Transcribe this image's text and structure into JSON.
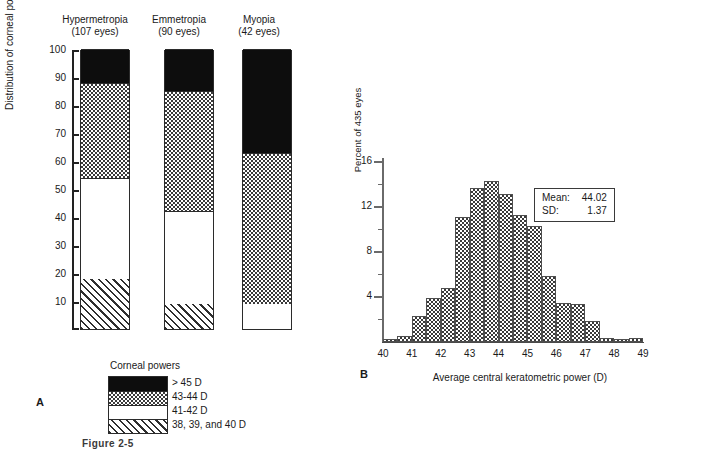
{
  "figure": {
    "caption": "Figure 2-5"
  },
  "panelA": {
    "letter": "A",
    "y_axis_label": "Distribution of corneal powers (%)",
    "y_ticks": [
      10,
      20,
      30,
      40,
      50,
      60,
      70,
      80,
      90,
      100
    ],
    "columns": [
      {
        "name": "Hypermetropia",
        "sub": "(107 eyes)"
      },
      {
        "name": "Emmetropia",
        "sub": "(90 eyes)"
      },
      {
        "name": "Myopia",
        "sub": "(42 eyes)"
      }
    ],
    "legend_title": "Corneal powers",
    "legend": [
      {
        "label": "> 45 D",
        "pattern": "black"
      },
      {
        "label": "43-44 D",
        "pattern": "check"
      },
      {
        "label": "41-42 D",
        "pattern": "white"
      },
      {
        "label": "38, 39, and 40 D",
        "pattern": "hatch"
      }
    ]
  },
  "panelB": {
    "letter": "B",
    "y_axis_label": "Percent of 435 eyes",
    "x_axis_label": "Average central keratometric power (D)",
    "stats": {
      "mean_label": "Mean:",
      "mean_value": "44.02",
      "sd_label": "SD:",
      "sd_value": "1.37"
    }
  },
  "chart_data": [
    {
      "type": "bar",
      "id": "panel-a-stacked",
      "title": "Distribution of corneal powers (%)",
      "xlabel": "",
      "ylabel": "Distribution of corneal powers (%)",
      "ylim": [
        0,
        100
      ],
      "grid": false,
      "stacked": true,
      "categories": [
        "Hypermetropia (107 eyes)",
        "Emmetropia (90 eyes)",
        "Myopia (42 eyes)"
      ],
      "series": [
        {
          "name": "38, 39, and 40 D",
          "pattern": "hatch",
          "values": [
            18,
            9,
            0
          ]
        },
        {
          "name": "41-42 D",
          "pattern": "white",
          "values": [
            36,
            33,
            9
          ]
        },
        {
          "name": "43-44 D",
          "pattern": "check",
          "values": [
            34,
            43,
            54
          ]
        },
        {
          "name": "> 45 D",
          "pattern": "black",
          "values": [
            12,
            15,
            37
          ]
        }
      ],
      "segment_boundaries": {
        "Hypermetropia (107 eyes)": [
          0,
          18,
          54,
          88,
          100
        ],
        "Emmetropia (90 eyes)": [
          0,
          9,
          42,
          85,
          100
        ],
        "Myopia (42 eyes)": [
          0,
          0,
          9,
          63,
          100
        ]
      }
    },
    {
      "type": "bar",
      "id": "panel-b-histogram",
      "title": "",
      "xlabel": "Average central keratometric power (D)",
      "ylabel": "Percent of 435 eyes",
      "xlim": [
        40,
        49
      ],
      "ylim": [
        0,
        16
      ],
      "grid": false,
      "bin_width": 0.5,
      "x_ticks": [
        40,
        41,
        42,
        43,
        44,
        45,
        46,
        47,
        48,
        49
      ],
      "y_ticks": [
        4,
        8,
        12,
        16
      ],
      "y_minor_ticks": [
        2,
        6,
        10,
        14
      ],
      "bin_starts": [
        40.0,
        40.5,
        41.0,
        41.5,
        42.0,
        42.5,
        43.0,
        43.5,
        44.0,
        44.5,
        45.0,
        45.5,
        46.0,
        46.5,
        47.0,
        47.5,
        48.0,
        48.5
      ],
      "values": [
        0.2,
        0.5,
        2.3,
        3.9,
        4.7,
        11.0,
        13.6,
        14.2,
        13.1,
        11.2,
        10.2,
        5.8,
        3.4,
        3.3,
        1.8,
        0.3,
        0.2,
        0.3
      ],
      "annotations": [
        "Mean: 44.02",
        "SD: 1.37"
      ]
    }
  ]
}
